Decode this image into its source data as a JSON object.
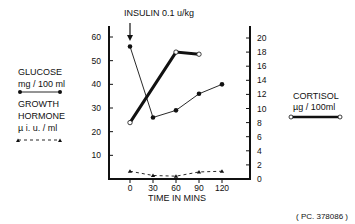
{
  "chart_data": {
    "type": "line",
    "title": "",
    "annotation": "INSULIN 0.1 u/kg",
    "annotation_x": 0,
    "xlabel": "TIME IN MINS",
    "x": [
      0,
      30,
      60,
      90,
      120
    ],
    "x_ticks": [
      "0",
      "30",
      "60",
      "90",
      "120"
    ],
    "left_axis": {
      "ylim": [
        0,
        65
      ],
      "ticks": [
        10,
        20,
        30,
        40,
        50,
        60
      ],
      "tick_labels": [
        "10",
        "20",
        "30",
        "40",
        "50",
        "60"
      ]
    },
    "right_axis": {
      "ylim": [
        0,
        21
      ],
      "ticks": [
        0,
        2,
        4,
        6,
        8,
        10,
        12,
        14,
        16,
        18,
        20
      ],
      "tick_labels": [
        "0",
        "2",
        "4",
        "6",
        "8",
        "10",
        "12",
        "14",
        "16",
        "18",
        "20"
      ]
    },
    "series": [
      {
        "name": "GLUCOSE",
        "units": "mg / 100 ml",
        "axis": "left",
        "style": "thin-solid-filled-circle",
        "x": [
          0,
          30,
          60,
          90,
          120
        ],
        "values": [
          56,
          26,
          29,
          36,
          40
        ]
      },
      {
        "name": "GROWTH HORMONE",
        "units": "µ i. u. / ml",
        "axis": "right",
        "style": "dashed-triangle",
        "x": [
          0,
          30,
          60,
          90,
          120
        ],
        "values": [
          1.1,
          0.5,
          0.4,
          1.0,
          1.1
        ]
      },
      {
        "name": "CORTISOL",
        "units": "µg / 100ml",
        "axis": "right",
        "style": "thick-solid-open-circle",
        "x": [
          0,
          60,
          90
        ],
        "values": [
          8,
          18,
          17.7
        ]
      }
    ],
    "legend": {
      "placement": "left-and-right",
      "glucose_title": "GLUCOSE",
      "glucose_units": "mg / 100 ml",
      "gh_title_1": "GROWTH",
      "gh_title_2": "HORMONE",
      "gh_units": "µ i. u. / ml",
      "cortisol_title": "CORTISOL",
      "cortisol_units": "µg / 100ml"
    },
    "footnote": "( PC. 378086 )"
  }
}
